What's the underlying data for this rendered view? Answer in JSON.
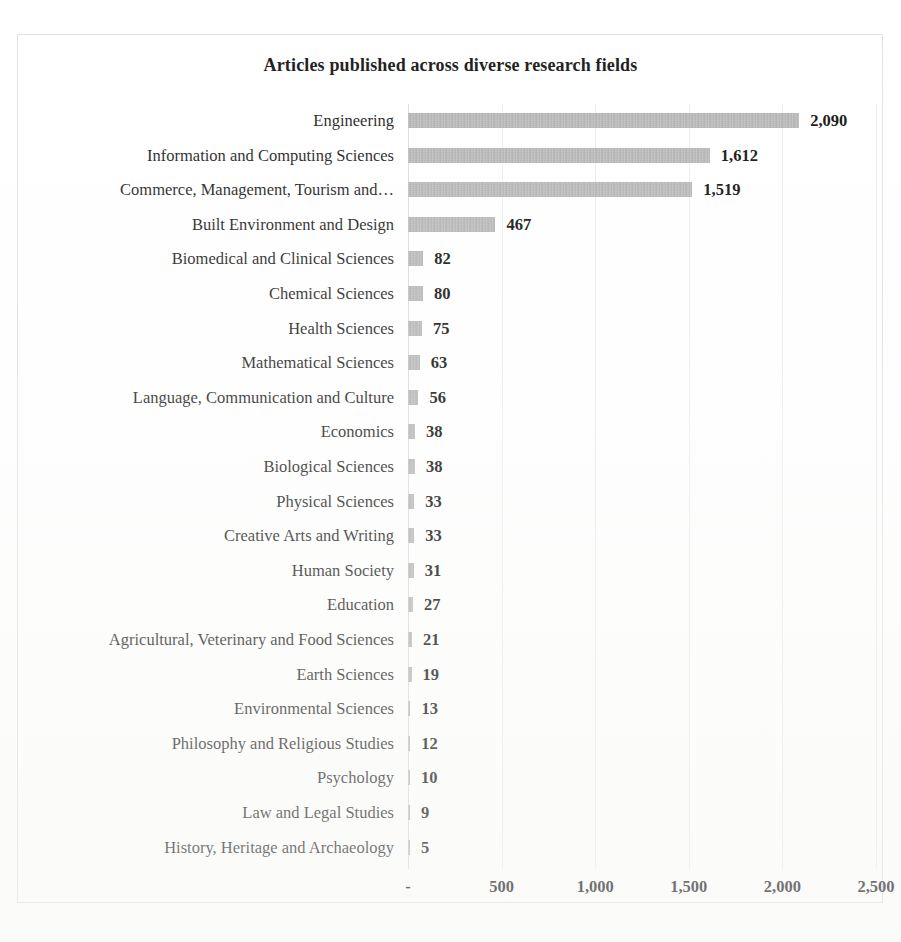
{
  "chart_data": {
    "type": "bar",
    "orientation": "horizontal",
    "title": "Articles published across diverse research fields",
    "xlabel": "",
    "ylabel": "",
    "xlim": [
      0,
      2500
    ],
    "grid": true,
    "legend": "none",
    "tick_labels": [
      "-",
      "500",
      "1,000",
      "1,500",
      "2,000",
      "2,500"
    ],
    "tick_values": [
      0,
      500,
      1000,
      1500,
      2000,
      2500
    ],
    "bar_color": "#b3b3b3",
    "categories": [
      "Engineering",
      "Information and Computing Sciences",
      "Commerce, Management, Tourism and…",
      "Built Environment and Design",
      "Biomedical and Clinical Sciences",
      "Chemical Sciences",
      "Health Sciences",
      "Mathematical Sciences",
      "Language, Communication and Culture",
      "Economics",
      "Biological Sciences",
      "Physical Sciences",
      "Creative Arts and Writing",
      "Human Society",
      "Education",
      "Agricultural, Veterinary and Food Sciences",
      "Earth Sciences",
      "Environmental Sciences",
      "Philosophy and Religious Studies",
      "Psychology",
      "Law and Legal Studies",
      "History, Heritage and Archaeology"
    ],
    "values": [
      2090,
      1612,
      1519,
      467,
      82,
      80,
      75,
      63,
      56,
      38,
      38,
      33,
      33,
      31,
      27,
      21,
      19,
      13,
      12,
      10,
      9,
      5
    ],
    "value_labels": [
      "2,090",
      "1,612",
      "1,519",
      "467",
      "82",
      "80",
      "75",
      "63",
      "56",
      "38",
      "38",
      "33",
      "33",
      "31",
      "27",
      "21",
      "19",
      "13",
      "12",
      "10",
      "9",
      "5"
    ]
  },
  "caption_fragment": ""
}
